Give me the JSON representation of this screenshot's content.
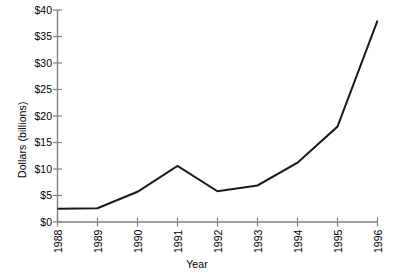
{
  "chart_data": {
    "type": "line",
    "title": "",
    "xlabel": "Year",
    "ylabel": "Dollars (billions)",
    "categories": [
      "1988",
      "1989",
      "1990",
      "1991",
      "1992",
      "1993",
      "1994",
      "1995",
      "1996"
    ],
    "x": [
      1988,
      1989,
      1990,
      1991,
      1992,
      1993,
      1994,
      1995,
      1996
    ],
    "values": [
      2.5,
      2.6,
      5.7,
      10.6,
      5.8,
      6.9,
      11.2,
      18.0,
      38.0
    ],
    "series": [
      {
        "name": "Dollars (billions)",
        "values": [
          2.5,
          2.6,
          5.7,
          10.6,
          5.8,
          6.9,
          11.2,
          18.0,
          38.0
        ]
      }
    ],
    "ylim": [
      0,
      40
    ],
    "ytick_values": [
      0,
      5,
      10,
      15,
      20,
      25,
      30,
      35,
      40
    ],
    "ytick_labels": [
      "$0",
      "$5",
      "$10",
      "$15",
      "$20",
      "$25",
      "$30",
      "$35",
      "$40"
    ],
    "xtick_labels": [
      "1988",
      "1989",
      "1990",
      "1991",
      "1992",
      "1993",
      "1994",
      "1995",
      "1996"
    ],
    "grid": false,
    "legend": false,
    "legend_position": "none",
    "line_color": "#1a1a1a",
    "axis_color": "#808080",
    "background_color": "#ffffff"
  }
}
